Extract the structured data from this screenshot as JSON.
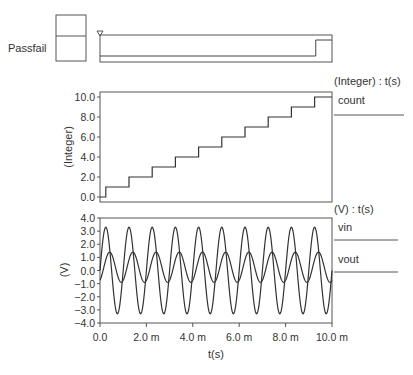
{
  "digital": {
    "label": "Passfail",
    "signal_transition_fraction": 0.93
  },
  "chart_data": [
    {
      "type": "line",
      "title": "(Integer) : t(s)",
      "ylabel": "(Integer)",
      "xlabel": "",
      "xlim": [
        0,
        0.01
      ],
      "ylim": [
        0,
        10
      ],
      "yticks": [
        "0.0",
        "2.0",
        "4.0",
        "6.0",
        "8.0",
        "10.0"
      ],
      "grid": false,
      "legend_position": "right",
      "series": [
        {
          "name": "count",
          "step": true,
          "x": [
            0,
            0.00025,
            0.00125,
            0.00225,
            0.00325,
            0.00425,
            0.00525,
            0.00625,
            0.00725,
            0.00825,
            0.00925,
            0.01
          ],
          "values": [
            0,
            1,
            2,
            3,
            4,
            5,
            6,
            7,
            8,
            9,
            10,
            10
          ]
        }
      ]
    },
    {
      "type": "line",
      "title": "(V) : t(s)",
      "ylabel": "(V)",
      "xlabel": "t(s)",
      "xlim": [
        0,
        0.01
      ],
      "ylim": [
        -4,
        4
      ],
      "yticks": [
        "4.0",
        "3.0",
        "2.0",
        "1.0",
        "0.0",
        "-1.0",
        "-2.0",
        "-3.0",
        "-4.0"
      ],
      "xticks": [
        "0.0",
        "2.0 m",
        "4.0 m",
        "6.0 m",
        "8.0 m",
        "10.0 m"
      ],
      "grid": false,
      "legend_position": "right",
      "series": [
        {
          "name": "vin",
          "waveform": "sine",
          "frequency_hz": 1000,
          "amplitude": 3.3,
          "offset": 0.0,
          "phase_deg": 0
        },
        {
          "name": "vout",
          "waveform": "sine",
          "frequency_hz": 1000,
          "amplitude": 1.15,
          "offset": 0.25,
          "phase_deg": -60
        }
      ]
    }
  ]
}
